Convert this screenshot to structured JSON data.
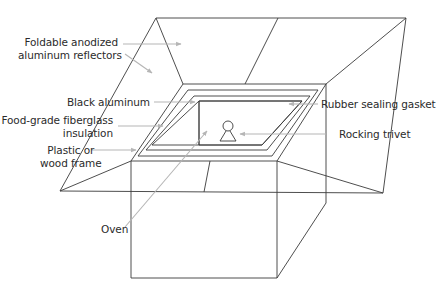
{
  "diagram": {
    "colors": {
      "line": "#3a3a3a",
      "leader": "#b5b5b5",
      "text": "#2b2b2b",
      "background": "#ffffff"
    },
    "labels": {
      "reflectors_line1": "Foldable anodized",
      "reflectors_line2": "aluminum reflectors",
      "black_aluminum": "Black aluminum",
      "insulation_line1": "Food-grade fiberglass",
      "insulation_line2": "insulation",
      "frame_line1": "Plastic or",
      "frame_line2": "wood frame",
      "oven": "Oven",
      "gasket": "Rubber sealing gasket",
      "trivet": "Rocking trivet"
    }
  }
}
